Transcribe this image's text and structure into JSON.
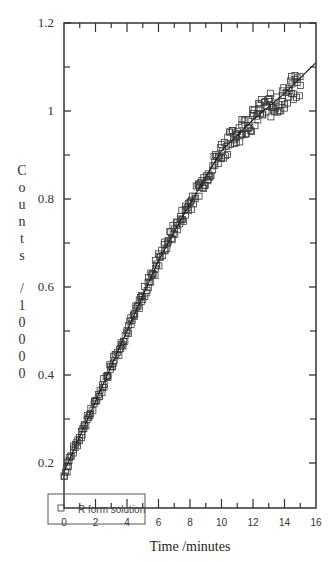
{
  "chart_data": {
    "type": "scatter",
    "title": "",
    "xlabel": "Time /minutes",
    "ylabel": "Counts /10000",
    "xlim": [
      0,
      16
    ],
    "ylim": [
      0.1,
      1.2
    ],
    "x_ticks": [
      0,
      2,
      4,
      6,
      8,
      10,
      12,
      14,
      16
    ],
    "y_ticks": [
      0.2,
      0.4,
      0.6,
      0.8,
      1,
      1.2
    ],
    "y_tick_labels": [
      "0.2",
      "0.4",
      "0.6",
      "0.8",
      "1",
      "1.2"
    ],
    "grid": false,
    "legend": {
      "position": "lower-left",
      "entries": [
        "R form solution"
      ]
    },
    "series": [
      {
        "name": "R form solution",
        "marker": "square",
        "x": [
          0,
          0.5,
          1,
          1.5,
          2,
          2.5,
          3,
          3.5,
          4,
          4.5,
          5,
          5.5,
          6,
          6.5,
          7,
          7.5,
          8,
          8.5,
          9,
          9.5,
          10,
          10.5,
          11,
          11.5,
          12,
          12.5,
          13,
          13.5,
          14,
          14.5,
          15
        ],
        "y": [
          0.17,
          0.22,
          0.26,
          0.3,
          0.34,
          0.38,
          0.42,
          0.46,
          0.5,
          0.54,
          0.58,
          0.62,
          0.66,
          0.7,
          0.73,
          0.76,
          0.79,
          0.82,
          0.85,
          0.88,
          0.91,
          0.93,
          0.95,
          0.97,
          0.98,
          1.0,
          1.01,
          1.02,
          1.03,
          1.05,
          1.06
        ]
      },
      {
        "name": "fit",
        "marker": "line",
        "x": [
          0,
          2,
          4,
          6,
          8,
          10,
          12,
          14,
          16
        ],
        "y": [
          0.18,
          0.34,
          0.5,
          0.66,
          0.79,
          0.91,
          0.98,
          1.04,
          1.11
        ]
      }
    ]
  }
}
